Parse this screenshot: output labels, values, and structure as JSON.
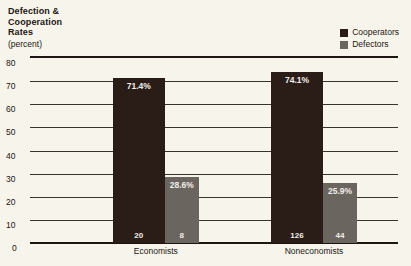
{
  "chart_data": {
    "type": "bar",
    "title_lines": [
      "Defection &",
      "Cooperation",
      "Rates"
    ],
    "subtitle": "(percent)",
    "xlabel": "",
    "ylabel": "",
    "ylim": [
      0,
      80
    ],
    "yticks": [
      80,
      70,
      60,
      50,
      40,
      30,
      20,
      10,
      0
    ],
    "ytick_labels": [
      "80",
      "70",
      "60",
      "50",
      "40",
      "30",
      "20",
      "10",
      "0"
    ],
    "grid": true,
    "legend_position": "top-right",
    "categories": [
      "Economists",
      "Noneconomists"
    ],
    "series": [
      {
        "name": "Cooperators",
        "color": "#2a1d18",
        "values": [
          71.4,
          74.1
        ],
        "value_labels": [
          "71.4%",
          "74.1%"
        ],
        "counts": [
          20,
          126
        ],
        "count_labels": [
          "20",
          "126"
        ]
      },
      {
        "name": "Defectors",
        "color": "#6b6560",
        "values": [
          28.6,
          25.9
        ],
        "value_labels": [
          "28.6%",
          "25.9%"
        ],
        "counts": [
          8,
          44
        ],
        "count_labels": [
          "8",
          "44"
        ]
      }
    ]
  },
  "legend": {
    "items": [
      {
        "label": "Cooperators",
        "color": "#2a1d18"
      },
      {
        "label": "Defectors",
        "color": "#6b6560"
      }
    ]
  },
  "colors": {
    "background": "#f7f4ec",
    "ink": "#1c1512",
    "cooperators": "#2a1d18",
    "defectors": "#6b6560",
    "gridline": "#3b322c",
    "bar_text": "#f2efe7"
  }
}
